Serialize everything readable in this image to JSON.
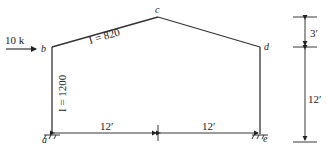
{
  "diagram": {
    "type": "gable-frame",
    "load": {
      "label": "10 k",
      "at_joint": "b"
    },
    "joints": {
      "a": "a",
      "b": "b",
      "c": "c",
      "d": "d",
      "e": "e"
    },
    "members": {
      "column_ab": {
        "label": "I = 1200"
      },
      "rafter_bc": {
        "label": "I = 820"
      }
    },
    "dimensions": {
      "span_left": "12′",
      "span_right": "12′",
      "rise": "3′",
      "column_height": "12′"
    }
  }
}
